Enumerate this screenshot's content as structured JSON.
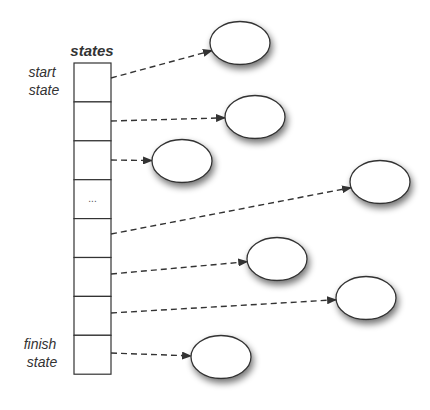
{
  "title": "states",
  "labels": {
    "start": [
      "start",
      "state"
    ],
    "finish": [
      "finish",
      "state"
    ]
  },
  "array": {
    "x": 74,
    "y": 63,
    "width": 37,
    "cell_height": 38.9,
    "cell_count": 8,
    "ellipsis_cell_index": 3,
    "ellipsis_text": "..."
  },
  "states": [
    {
      "cx": 240,
      "cy": 43,
      "from_y": 78
    },
    {
      "cx": 255,
      "cy": 117,
      "from_y": 121
    },
    {
      "cx": 182,
      "cy": 161,
      "from_y": 160
    },
    {
      "cx": 380,
      "cy": 182,
      "from_y": 234
    },
    {
      "cx": 277,
      "cy": 259,
      "from_y": 274
    },
    {
      "cx": 366,
      "cy": 298,
      "from_y": 313
    },
    {
      "cx": 221,
      "cy": 357,
      "from_y": 353
    }
  ],
  "ellipse": {
    "rx": 30,
    "ry": 21.5
  },
  "colors": {
    "stroke": "#333333",
    "fill": "#ffffff",
    "shadow": "#9a9a9a",
    "text": "#333333"
  }
}
